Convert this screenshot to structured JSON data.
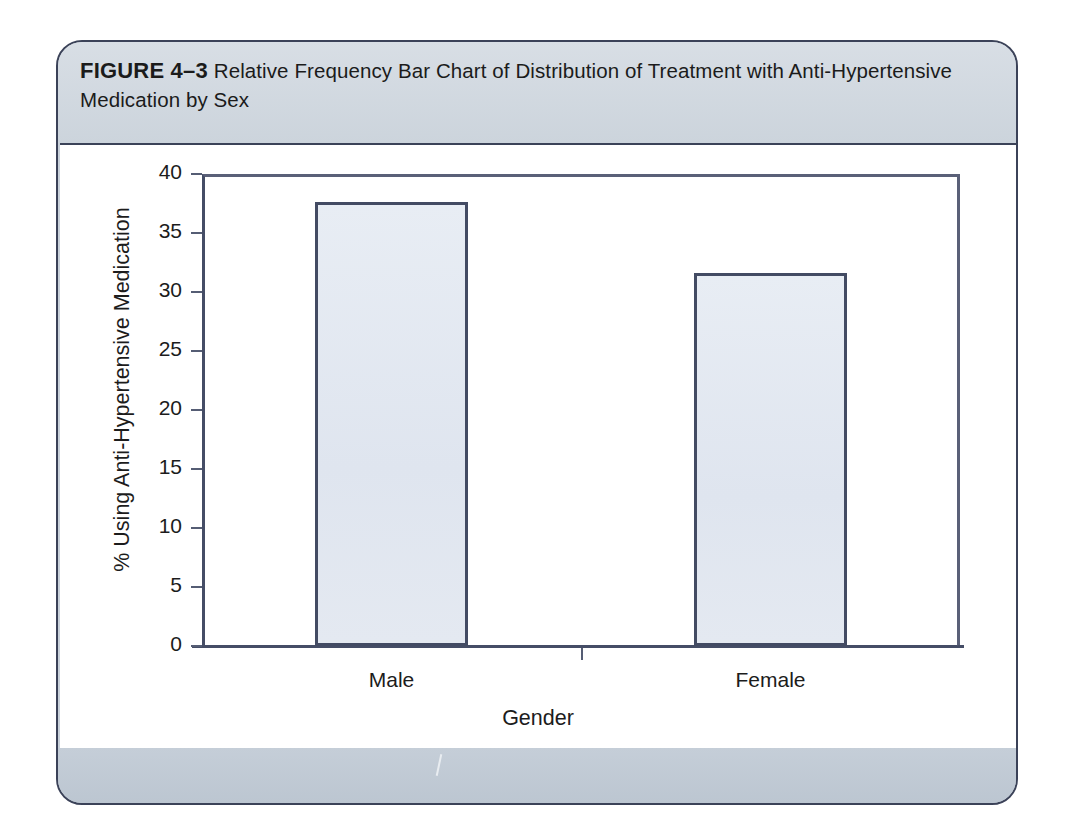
{
  "figure": {
    "label": "FIGURE 4–3",
    "caption": "Relative Frequency Bar Chart of Distribution of Treatment with Anti-Hypertensive Medication by Sex"
  },
  "colors": {
    "card_border": "#3b4258",
    "caption_band": "#d4dae2",
    "footer_band": "#c0cad4",
    "axis": "#454d66",
    "bar_fill": "#e2e8f1",
    "bar_border": "#434b63",
    "text": "#1c1c1c"
  },
  "chart_data": {
    "type": "bar",
    "title": "",
    "categories": [
      "Male",
      "Female"
    ],
    "values": [
      37.6,
      31.6
    ],
    "xlabel": "Gender",
    "ylabel": "% Using Anti-Hypertensive Medication",
    "ylim": [
      0,
      40
    ],
    "ytick_labels": [
      "0",
      "5",
      "10",
      "15",
      "20",
      "25",
      "30",
      "35",
      "40"
    ],
    "ytick_values": [
      0,
      5,
      10,
      15,
      20,
      25,
      30,
      35,
      40
    ],
    "grid": false,
    "legend": "none",
    "legend_position": "none"
  }
}
